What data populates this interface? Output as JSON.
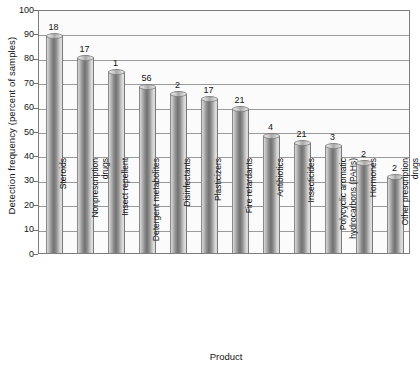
{
  "chart_data": {
    "type": "bar",
    "title": "",
    "xlabel": "Product",
    "ylabel": "Detection frequency (percent of samples)",
    "ylim": [
      0,
      100
    ],
    "yticks": [
      0,
      10,
      20,
      30,
      40,
      50,
      60,
      70,
      80,
      90,
      100
    ],
    "grid": true,
    "legend": null,
    "categories": [
      "Steroids",
      "Nonprescription drugs",
      "Insect repellent",
      "Detergent metabolites",
      "Disinfectants",
      "Plasticizers",
      "Fire retardants",
      "Antibiotics",
      "Insecticides",
      "Polycyclic aromatic hydrocarbons (PAHs)",
      "Hormones",
      "Other prescription drugs"
    ],
    "category_lines": [
      [
        "Steroids"
      ],
      [
        "Nonprescription",
        "drugs"
      ],
      [
        "Insect repellent"
      ],
      [
        "Detergent metabolites"
      ],
      [
        "Disinfectants"
      ],
      [
        "Plasticizers"
      ],
      [
        "Fire retardants"
      ],
      [
        "Antibiotics"
      ],
      [
        "Insecticides"
      ],
      [
        "Polycyclic aromatic",
        "hydrocarbons (PAHs)"
      ],
      [
        "Hormones"
      ],
      [
        "Other prescription",
        "drugs"
      ]
    ],
    "values": [
      89,
      80,
      74,
      68,
      65,
      63,
      59,
      48,
      45,
      44,
      37,
      31
    ],
    "bar_labels": [
      "18",
      "17",
      "1",
      "56",
      "2",
      "17",
      "21",
      "4",
      "21",
      "3",
      "2",
      "2"
    ],
    "annotation_note": "Numbers above bars indicate number of compounds measured"
  },
  "axes": {
    "y_tick_labels": [
      "100",
      "90",
      "80",
      "70",
      "60",
      "50",
      "40",
      "30",
      "20",
      "10",
      "0"
    ],
    "y_title": "Detection frequency (percent of samples)",
    "x_title": "Product"
  },
  "colors": {
    "bar_light": "#d8d8d8",
    "bar_dark": "#717171",
    "grid": "#9a9a9a",
    "frame": "#7d7d7d",
    "text": "#141414",
    "plot_bg": "#fbfbfb",
    "page_bg": "#ffffff"
  }
}
